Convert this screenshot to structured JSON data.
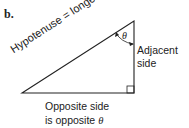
{
  "figure": {
    "panel_label": "b.",
    "hypotenuse_label": "Hypotenuse = longest side",
    "adjacent_label_line1": "Adjacent",
    "adjacent_label_line2": "side",
    "opposite_label_line1": "Opposite side",
    "opposite_label_line2_prefix": "is opposite ",
    "theta_symbol": "θ",
    "angle_label": "θ",
    "colors": {
      "line": "#222222",
      "background": "#ffffff"
    }
  }
}
